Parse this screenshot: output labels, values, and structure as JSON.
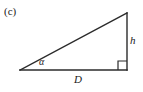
{
  "figure": {
    "panel_label": "(c)",
    "background_color": "#ffffff",
    "stroke_color": "#2b2b2b",
    "text_color": "#1a1a1a",
    "labels": {
      "base": "D",
      "height": "h",
      "angle": "α"
    },
    "geometry": {
      "left_vertex": [
        20,
        70
      ],
      "bottom_right_vertex": [
        127,
        70
      ],
      "apex": [
        127,
        13
      ],
      "base_length_px": 107,
      "height_length_px": 57,
      "right_angle_marker": {
        "x": 118,
        "y": 61,
        "size": 9
      },
      "angle_arc": {
        "cx": 20,
        "cy": 70,
        "radius": 22
      }
    }
  }
}
